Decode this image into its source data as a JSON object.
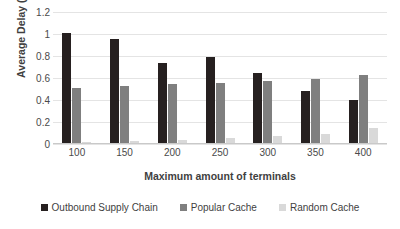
{
  "chart_data": {
    "type": "bar",
    "title": "",
    "xlabel": "Maximum amount of terminals",
    "ylabel": "Average Delay (s)",
    "categories": [
      "100",
      "150",
      "200",
      "250",
      "300",
      "350",
      "400"
    ],
    "ylim": [
      0,
      1.2
    ],
    "yticks": [
      "0",
      "0.2",
      "0.4",
      "0.6",
      "0.8",
      "1",
      "1.2"
    ],
    "ytick_values": [
      0,
      0.2,
      0.4,
      0.6,
      0.8,
      1.0,
      1.2
    ],
    "grid": true,
    "legend_position": "bottom",
    "series": [
      {
        "name": "Outbound Supply Chain",
        "color": "#262020",
        "values": [
          1.0,
          0.95,
          0.73,
          0.78,
          0.64,
          0.47,
          0.39
        ]
      },
      {
        "name": "Popular Cache",
        "color": "#7f7f7f",
        "values": [
          0.5,
          0.52,
          0.54,
          0.55,
          0.56,
          0.58,
          0.62
        ]
      },
      {
        "name": "Random Cache",
        "color": "#d9d9d9",
        "values": [
          0.01,
          0.02,
          0.03,
          0.05,
          0.06,
          0.08,
          0.14
        ]
      }
    ]
  }
}
